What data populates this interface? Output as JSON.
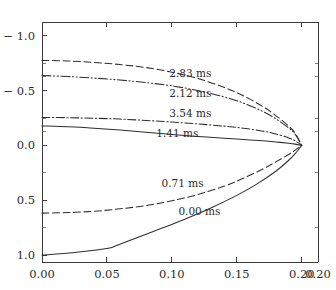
{
  "chart_data": {
    "type": "line",
    "title": "",
    "subtitle": "",
    "xlabel": "",
    "ylabel": "",
    "xlim": [
      0.0,
      0.2125
    ],
    "ylim": [
      -1.125,
      1.0625
    ],
    "y_inverted": true,
    "grid": false,
    "legend": "inline-labels",
    "x_ticks": [
      0.0,
      0.05,
      0.1,
      0.15,
      0.2,
      0.2125
    ],
    "x_tick_labels": [
      "0.00",
      "0.05",
      "0.10",
      "0.15",
      "0.20",
      "0.20"
    ],
    "y_ticks": [
      -1.0,
      -0.5,
      0.0,
      0.5,
      1.0
    ],
    "y_tick_labels": [
      "− 1.0",
      "− 0.5",
      "0.0",
      "0.5",
      "1.0"
    ],
    "y_minor_ticks": [
      -0.75,
      -0.625,
      -0.25,
      -0.125,
      0.25,
      0.75
    ],
    "convergence_point": [
      0.2,
      0.0
    ],
    "series": [
      {
        "name": "2.83 ms",
        "label": "2.83 ms",
        "style": "dashed",
        "dasharray": "7,3.5",
        "label_x": 0.098,
        "label_y": -0.66,
        "points": [
          [
            0.0,
            -0.775
          ],
          [
            0.02,
            -0.77
          ],
          [
            0.04,
            -0.757
          ],
          [
            0.06,
            -0.737
          ],
          [
            0.08,
            -0.71
          ],
          [
            0.1,
            -0.668
          ],
          [
            0.12,
            -0.61
          ],
          [
            0.14,
            -0.53
          ],
          [
            0.155,
            -0.452
          ],
          [
            0.17,
            -0.355
          ],
          [
            0.18,
            -0.272
          ],
          [
            0.19,
            -0.175
          ],
          [
            0.195,
            -0.11
          ],
          [
            0.2,
            0.0
          ]
        ]
      },
      {
        "name": "2.12 ms",
        "label": "2.12 ms",
        "style": "dash-dot-dot",
        "dasharray": "9,2.5,1.2,2.5,1.2,2.5",
        "label_x": 0.098,
        "label_y": -0.475,
        "points": [
          [
            0.0,
            -0.637
          ],
          [
            0.02,
            -0.628
          ],
          [
            0.04,
            -0.614
          ],
          [
            0.06,
            -0.596
          ],
          [
            0.08,
            -0.573
          ],
          [
            0.1,
            -0.543
          ],
          [
            0.12,
            -0.5
          ],
          [
            0.14,
            -0.443
          ],
          [
            0.155,
            -0.386
          ],
          [
            0.17,
            -0.31
          ],
          [
            0.18,
            -0.243
          ],
          [
            0.19,
            -0.158
          ],
          [
            0.195,
            -0.1
          ],
          [
            0.2,
            0.0
          ]
        ]
      },
      {
        "name": "3.54 ms",
        "label": "3.54 ms",
        "style": "dash-dot",
        "dasharray": "8,2.5,1.3,2.5",
        "label_x": 0.098,
        "label_y": -0.295,
        "points": [
          [
            0.0,
            -0.255
          ],
          [
            0.02,
            -0.253
          ],
          [
            0.04,
            -0.248
          ],
          [
            0.06,
            -0.24
          ],
          [
            0.08,
            -0.228
          ],
          [
            0.1,
            -0.213
          ],
          [
            0.12,
            -0.196
          ],
          [
            0.14,
            -0.176
          ],
          [
            0.155,
            -0.157
          ],
          [
            0.17,
            -0.13
          ],
          [
            0.18,
            -0.105
          ],
          [
            0.19,
            -0.068
          ],
          [
            0.195,
            -0.042
          ],
          [
            0.2,
            0.0
          ]
        ]
      },
      {
        "name": "1.41 ms",
        "label": "1.41 ms",
        "style": "solid-thin",
        "dasharray": "none",
        "label_x": 0.088,
        "label_y": -0.115,
        "points": [
          [
            0.0,
            -0.178
          ],
          [
            0.02,
            -0.17
          ],
          [
            0.04,
            -0.157
          ],
          [
            0.06,
            -0.14
          ],
          [
            0.08,
            -0.12
          ],
          [
            0.1,
            -0.1
          ],
          [
            0.12,
            -0.082
          ],
          [
            0.14,
            -0.066
          ],
          [
            0.155,
            -0.054
          ],
          [
            0.17,
            -0.042
          ],
          [
            0.18,
            -0.032
          ],
          [
            0.19,
            -0.02
          ],
          [
            0.195,
            -0.012
          ],
          [
            0.2,
            0.0
          ]
        ]
      },
      {
        "name": "0.71 ms",
        "label": "0.71 ms",
        "style": "dashed",
        "dasharray": "7,3.5",
        "label_x": 0.092,
        "label_y": 0.345,
        "points": [
          [
            0.0,
            0.617
          ],
          [
            0.02,
            0.612
          ],
          [
            0.04,
            0.6
          ],
          [
            0.06,
            0.578
          ],
          [
            0.08,
            0.548
          ],
          [
            0.1,
            0.505
          ],
          [
            0.12,
            0.447
          ],
          [
            0.14,
            0.372
          ],
          [
            0.155,
            0.3
          ],
          [
            0.17,
            0.215
          ],
          [
            0.18,
            0.15
          ],
          [
            0.19,
            0.082
          ],
          [
            0.195,
            0.043
          ],
          [
            0.2,
            0.0
          ]
        ]
      },
      {
        "name": "0.00 ms",
        "label": "0.00 ms",
        "style": "solid",
        "dasharray": "none",
        "label_x": 0.105,
        "label_y": 0.6,
        "points": [
          [
            0.0,
            1.0
          ],
          [
            0.025,
            0.975
          ],
          [
            0.05,
            0.94
          ],
          [
            0.0575,
            0.912
          ],
          [
            0.07,
            0.855
          ],
          [
            0.09,
            0.765
          ],
          [
            0.11,
            0.672
          ],
          [
            0.13,
            0.57
          ],
          [
            0.15,
            0.455
          ],
          [
            0.165,
            0.355
          ],
          [
            0.18,
            0.235
          ],
          [
            0.19,
            0.135
          ],
          [
            0.196,
            0.06
          ],
          [
            0.2,
            0.0
          ]
        ]
      }
    ]
  },
  "figure": {
    "background_color": "#ffffff",
    "ink_color": "#2e2e2e",
    "axis_color": "#3a3a3a"
  }
}
